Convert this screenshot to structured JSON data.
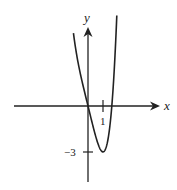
{
  "chart_data": {
    "type": "line",
    "title": "",
    "xlabel": "x",
    "ylabel": "y",
    "function": "f(x) = x^4 - 4x",
    "x_ticks": [
      {
        "value": 1,
        "label": "1"
      }
    ],
    "y_ticks": [
      {
        "value": -3,
        "label": "−3"
      }
    ],
    "annotations": [],
    "series": [
      {
        "name": "curve",
        "points": [
          {
            "x": -0.97,
            "y": 4.77
          },
          {
            "x": -0.5,
            "y": 2.06
          },
          {
            "x": 0,
            "y": 0
          },
          {
            "x": 0.5,
            "y": -1.94
          },
          {
            "x": 1,
            "y": -3
          },
          {
            "x": 1.3,
            "y": -2.34
          },
          {
            "x": 1.587,
            "y": 0
          },
          {
            "x": 1.8,
            "y": 3.3
          },
          {
            "x": 1.92,
            "y": 5.9
          }
        ]
      }
    ],
    "grid": false,
    "legend": null,
    "axis_color": "#222222",
    "curve_color": "#222222",
    "pixel_mapping": {
      "origin_px": [
        88,
        106
      ],
      "unit_x_px": 15,
      "unit_y_px": 15.3
    }
  },
  "labels": {
    "x_axis": "x",
    "y_axis": "y",
    "tick_x1": "1",
    "tick_y_neg3": "−3"
  }
}
